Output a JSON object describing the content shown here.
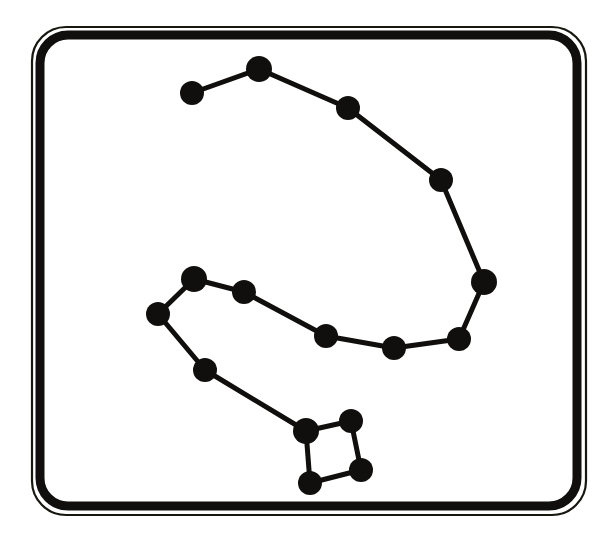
{
  "figure": {
    "background_color": "#ffffff",
    "ink_color": "#100f0d",
    "canvas": {
      "width": 611,
      "height": 537
    }
  },
  "plaque": {
    "name": "rounded-rectangle-plaque",
    "outer_hairline": {
      "x": 32,
      "y": 27,
      "width": 554,
      "height": 488,
      "radius": 34,
      "stroke_width": 2.2,
      "color": "#17160f"
    },
    "inner_band": {
      "x": 40,
      "y": 35,
      "width": 537,
      "height": 471,
      "radius": 28,
      "stroke_width": 9,
      "color": "#100f0d"
    }
  },
  "chart_data": {
    "type": "scatter",
    "xlabel": "",
    "ylabel": "",
    "xlim": [
      0,
      611
    ],
    "ylim": [
      0,
      537
    ],
    "grid": false,
    "legend": null,
    "marker_color": "#100f0d",
    "line_color": "#100f0d",
    "line_width": 5,
    "nodes": [
      {
        "id": "s1",
        "label": "star-1",
        "x": 192,
        "y": 93,
        "r": 12
      },
      {
        "id": "s2",
        "label": "star-2",
        "x": 259,
        "y": 69,
        "r": 13
      },
      {
        "id": "s3",
        "label": "star-3",
        "x": 348,
        "y": 108,
        "r": 12
      },
      {
        "id": "s4",
        "label": "star-4",
        "x": 441,
        "y": 180,
        "r": 12
      },
      {
        "id": "s5",
        "label": "star-5",
        "x": 484,
        "y": 282,
        "r": 13
      },
      {
        "id": "s6",
        "label": "star-6",
        "x": 459,
        "y": 339,
        "r": 12
      },
      {
        "id": "s7",
        "label": "star-7",
        "x": 394,
        "y": 348,
        "r": 12
      },
      {
        "id": "s8",
        "label": "star-8",
        "x": 326,
        "y": 336,
        "r": 12
      },
      {
        "id": "s9",
        "label": "star-9",
        "x": 244,
        "y": 292,
        "r": 12
      },
      {
        "id": "s10",
        "label": "star-10",
        "x": 194,
        "y": 279,
        "r": 13
      },
      {
        "id": "s11",
        "label": "star-11",
        "x": 158,
        "y": 314,
        "r": 12
      },
      {
        "id": "s12",
        "label": "star-12",
        "x": 205,
        "y": 370,
        "r": 12
      },
      {
        "id": "s13",
        "label": "star-13",
        "x": 306,
        "y": 431,
        "r": 13
      },
      {
        "id": "s14",
        "label": "star-14",
        "x": 351,
        "y": 421,
        "r": 12
      },
      {
        "id": "s15",
        "label": "star-15",
        "x": 361,
        "y": 470,
        "r": 12
      },
      {
        "id": "s16",
        "label": "star-16",
        "x": 310,
        "y": 483,
        "r": 12
      }
    ],
    "edges": [
      {
        "from": "s1",
        "to": "s2"
      },
      {
        "from": "s2",
        "to": "s3"
      },
      {
        "from": "s3",
        "to": "s4"
      },
      {
        "from": "s4",
        "to": "s5"
      },
      {
        "from": "s5",
        "to": "s6"
      },
      {
        "from": "s6",
        "to": "s7"
      },
      {
        "from": "s7",
        "to": "s8"
      },
      {
        "from": "s8",
        "to": "s9"
      },
      {
        "from": "s9",
        "to": "s10"
      },
      {
        "from": "s10",
        "to": "s11"
      },
      {
        "from": "s11",
        "to": "s12"
      },
      {
        "from": "s12",
        "to": "s13"
      },
      {
        "from": "s13",
        "to": "s14"
      },
      {
        "from": "s14",
        "to": "s15"
      },
      {
        "from": "s15",
        "to": "s16"
      },
      {
        "from": "s16",
        "to": "s13"
      }
    ]
  }
}
